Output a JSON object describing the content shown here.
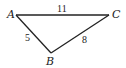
{
  "diagram": {
    "type": "triangle",
    "vertices": [
      {
        "name": "A",
        "x": 16,
        "y": 15,
        "label_x": 7,
        "label_y": 18
      },
      {
        "name": "B",
        "x": 51,
        "y": 53,
        "label_x": 46,
        "label_y": 65
      },
      {
        "name": "C",
        "x": 109,
        "y": 15,
        "label_x": 112,
        "label_y": 18
      }
    ],
    "sides": [
      {
        "from": "A",
        "to": "C",
        "length": "11",
        "label_x": 57,
        "label_y": 12
      },
      {
        "from": "A",
        "to": "B",
        "length": "5",
        "label_x": 25,
        "label_y": 41
      },
      {
        "from": "B",
        "to": "C",
        "length": "8",
        "label_x": 82,
        "label_y": 43
      }
    ],
    "stroke_color": "#222222"
  }
}
